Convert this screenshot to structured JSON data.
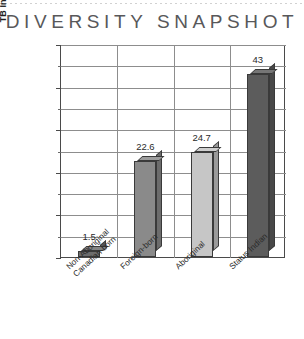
{
  "chart_data": {
    "type": "bar",
    "title": "DIVERSITY SNAPSHOT",
    "xlabel": "",
    "ylabel": "TB Incidence per 100 000 People",
    "categories": [
      "Non-Aboriginal\nCanadian-born",
      "Foreign-born",
      "Aboriginal",
      "Status Indian"
    ],
    "category_lines": [
      [
        "Non-Aboriginal",
        "Canadian-born"
      ],
      [
        "Foreign-born"
      ],
      [
        "Aboriginal"
      ],
      [
        "Status Indian"
      ]
    ],
    "values": [
      1.5,
      22.6,
      24.7,
      43
    ],
    "value_labels": [
      "1.5",
      "22.6",
      "24.7",
      "43"
    ],
    "bar_colors": [
      "#6d6d6d",
      "#8a8a8a",
      "#c6c6c6",
      "#5c5c5c"
    ],
    "ylim": [
      0,
      50
    ],
    "ytick_labels": [
      "0",
      "10",
      "20",
      "30",
      "40",
      "50"
    ],
    "ytick_values": [
      0,
      10,
      20,
      30,
      40,
      50
    ],
    "gridline_values": [
      5,
      10,
      15,
      20,
      25,
      30,
      35,
      40,
      45,
      50
    ],
    "grid": true,
    "legend": "none",
    "style": "3d-column"
  },
  "colors": {
    "title": "#58585a",
    "axis": "#4a4a4a",
    "grid": "#8d8d8d",
    "background": "#ffffff",
    "text": "#2a2a2a"
  }
}
